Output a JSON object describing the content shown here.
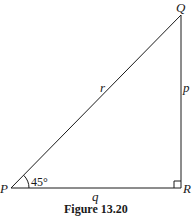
{
  "figure": {
    "caption": "Figure 13.20",
    "vertices": {
      "P": "P",
      "Q": "Q",
      "R": "R"
    },
    "sides": {
      "p": "p",
      "q": "q",
      "r": "r"
    },
    "angle_P": "45°",
    "right_angle_at": "R",
    "line_color": "#1a1a1a"
  }
}
